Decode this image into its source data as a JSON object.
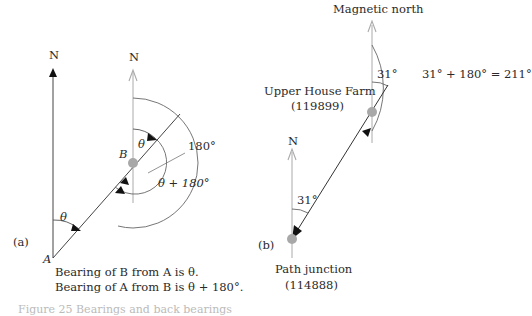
{
  "panel_a": {
    "label": "(a)",
    "north_label_a": "N",
    "north_label_b": "N",
    "point_a": "A",
    "point_b": "B",
    "angle_theta_at_a": "θ",
    "angle_theta_at_b": "θ",
    "angle_180": "180°",
    "angle_theta_plus_180": "θ + 180°",
    "caption_line1": "Bearing of B from A is θ.",
    "caption_line2": "Bearing of A from B is θ + 180°."
  },
  "panel_b": {
    "label": "(b)",
    "magnetic_north_label": "Magnetic north",
    "farm_name": "Upper House Farm",
    "farm_ref": "(119899)",
    "angle_at_farm": "31°",
    "back_bearing": "31° + 180° = 211°",
    "junction_north_label": "N",
    "angle_at_junction": "31°",
    "junction_name": "Path junction",
    "junction_ref": "(114888)"
  },
  "figure_caption": "Figure 25  Bearings and back bearings",
  "colors": {
    "line": "#333333",
    "grey_line": "#aaaaaa",
    "dot": "#a8a8a8",
    "arc": "#666666"
  }
}
